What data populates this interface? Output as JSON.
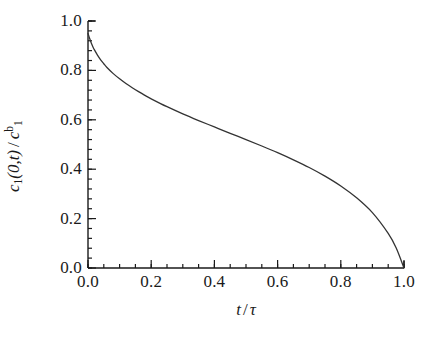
{
  "chart_data": {
    "type": "line",
    "title": "",
    "xlabel": "t / τ",
    "ylabel": "c₁(0,t) / c₁ᵇ",
    "xlim": [
      0.0,
      1.0
    ],
    "ylim": [
      0.0,
      1.0
    ],
    "grid": false,
    "legend": null,
    "xticks": [
      "0.0",
      "0.2",
      "0.4",
      "0.6",
      "0.8",
      "1.0"
    ],
    "xtick_values": [
      0.0,
      0.2,
      0.4,
      0.6,
      0.8,
      1.0
    ],
    "yticks": [
      "0.0",
      "0.2",
      "0.4",
      "0.6",
      "0.8",
      "1.0"
    ],
    "ytick_values": [
      0.0,
      0.2,
      0.4,
      0.6,
      0.8,
      1.0
    ],
    "x_minor_tick_step": 0.05,
    "y_minor_tick_step": 0.04,
    "series": [
      {
        "name": "surface concentration",
        "color": "#333333",
        "line_width": 1.3,
        "x": [
          0.0,
          0.005,
          0.01,
          0.015,
          0.02,
          0.03,
          0.04,
          0.05,
          0.06,
          0.08,
          0.1,
          0.12,
          0.14,
          0.16,
          0.18,
          0.2,
          0.25,
          0.3,
          0.35,
          0.4,
          0.45,
          0.5,
          0.55,
          0.6,
          0.65,
          0.7,
          0.75,
          0.8,
          0.85,
          0.9,
          0.95,
          0.975,
          1.0
        ],
        "y": [
          0.95,
          0.93,
          0.912,
          0.897,
          0.884,
          0.862,
          0.843,
          0.827,
          0.812,
          0.787,
          0.766,
          0.747,
          0.73,
          0.714,
          0.699,
          0.685,
          0.653,
          0.624,
          0.597,
          0.571,
          0.545,
          0.52,
          0.494,
          0.467,
          0.438,
          0.407,
          0.372,
          0.332,
          0.284,
          0.224,
          0.14,
          0.082,
          0.0
        ]
      }
    ]
  },
  "axes": {
    "x_title_numerator": "t",
    "x_title_slash": "/",
    "x_title_denominator": "τ",
    "y_title_symbol": "c",
    "y_title_sub": "1",
    "y_title_arg": "(0,t)",
    "y_title_slash": "/",
    "y_title_symbol2": "c",
    "y_title_sub2": "1",
    "y_title_sup2": "b"
  },
  "style": {
    "axis_color": "#1a1a1a",
    "curve_color": "#333333",
    "background": "#ffffff",
    "text_color": "#1a1a1a"
  }
}
